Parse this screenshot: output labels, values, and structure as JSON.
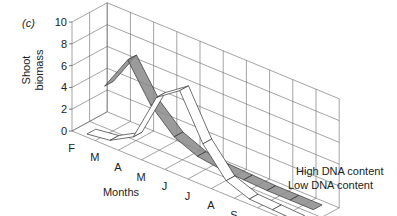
{
  "chart_data": {
    "type": "line",
    "style": "3d-ribbon",
    "panel_label": "(c)",
    "title": "",
    "xlabel": "Months",
    "ylabel": "Shoot biomass",
    "ylim": [
      0,
      10
    ],
    "yticks": [
      0,
      2,
      4,
      6,
      8,
      10
    ],
    "categories": [
      "F",
      "M",
      "A",
      "M",
      "J",
      "J",
      "A",
      "S",
      "O",
      "N"
    ],
    "grid": true,
    "legend_placement": "bottom-right (series labels at ribbon ends)",
    "series": [
      {
        "name": "High DNA content",
        "color": "#8a8a8a",
        "values": [
          3.5,
          6.8,
          3.5,
          1.5,
          0.6,
          0.3,
          0.2,
          0.1,
          0.1,
          0.1
        ]
      },
      {
        "name": "Low DNA content",
        "color": "#ffffff",
        "values": [
          0.0,
          0.3,
          1.5,
          6.0,
          7.5,
          3.5,
          1.0,
          0.2,
          0.1,
          0.0
        ]
      }
    ]
  }
}
